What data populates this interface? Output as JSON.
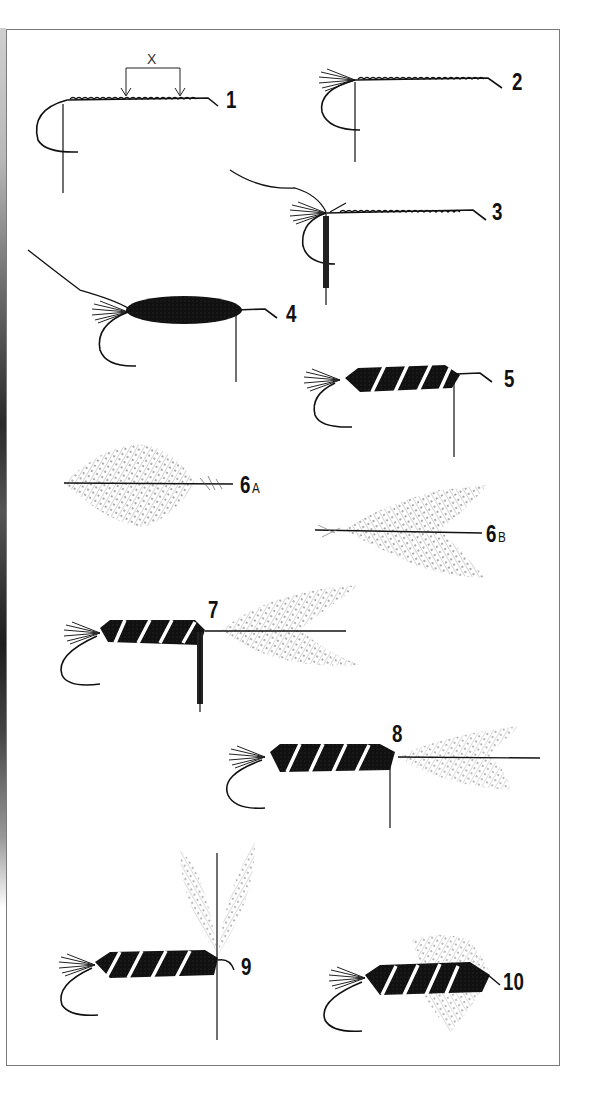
{
  "diagram": {
    "title": "",
    "type": "fly-tying step sequence",
    "dimension_marker": {
      "label": "X",
      "x1": 126,
      "x2": 180,
      "y_top": 68,
      "y_bottom": 98
    },
    "colors": {
      "ink": "#111111",
      "frame": "#7a7a7a",
      "background": "#ffffff",
      "rib": "#ffffff"
    },
    "steps": [
      {
        "id": "1",
        "label": "1",
        "sub": "",
        "stage": "bare hook with thread base",
        "label_pos": [
          226,
          88
        ]
      },
      {
        "id": "2",
        "label": "2",
        "sub": "",
        "stage": "tail tied in",
        "label_pos": [
          512,
          70
        ]
      },
      {
        "id": "3",
        "label": "3",
        "sub": "",
        "stage": "ribbing and dubbing added",
        "label_pos": [
          492,
          200
        ]
      },
      {
        "id": "4",
        "label": "4",
        "sub": "",
        "stage": "dubbed body wound",
        "label_pos": [
          286,
          302
        ]
      },
      {
        "id": "5",
        "label": "5",
        "sub": "",
        "stage": "rib wound over body",
        "label_pos": [
          504,
          367
        ]
      },
      {
        "id": "6A",
        "label": "6",
        "sub": "A",
        "stage": "hackle feather prepared",
        "label_pos": [
          240,
          475
        ]
      },
      {
        "id": "6B",
        "label": "6",
        "sub": "B",
        "stage": "hackle feather trimmed",
        "label_pos": [
          486,
          523
        ]
      },
      {
        "id": "7",
        "label": "7",
        "sub": "",
        "stage": "hackle tied in",
        "label_pos": [
          208,
          598
        ]
      },
      {
        "id": "8",
        "label": "8",
        "sub": "",
        "stage": "hackle positioned",
        "label_pos": [
          392,
          722
        ]
      },
      {
        "id": "9",
        "label": "9",
        "sub": "",
        "stage": "hackle raised",
        "label_pos": [
          240,
          955
        ]
      },
      {
        "id": "10",
        "label": "10",
        "sub": "",
        "stage": "hackle wound, fly finished",
        "label_pos": [
          504,
          970
        ]
      }
    ]
  }
}
